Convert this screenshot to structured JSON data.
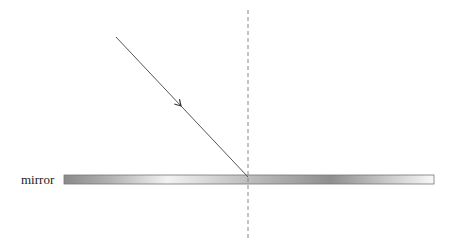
{
  "diagram": {
    "type": "reflection-incident-ray",
    "mirror": {
      "label": "mirror",
      "x": 64,
      "y": 175,
      "width": 370,
      "height": 9,
      "gradient_stops": [
        {
          "offset": 0,
          "color": "#8a8a8a"
        },
        {
          "offset": 0.12,
          "color": "#b0b0b0"
        },
        {
          "offset": 0.28,
          "color": "#f2f2f2"
        },
        {
          "offset": 0.45,
          "color": "#c8c8c8"
        },
        {
          "offset": 0.6,
          "color": "#a8a8a8"
        },
        {
          "offset": 0.72,
          "color": "#8e8e8e"
        },
        {
          "offset": 0.85,
          "color": "#c0c0c0"
        },
        {
          "offset": 1,
          "color": "#f8f8f8"
        }
      ],
      "border_color": "#777777"
    },
    "normal_line": {
      "x": 248,
      "y1": 10,
      "y2": 238,
      "color": "#888888",
      "dash": "4,3"
    },
    "incident_ray": {
      "x1": 116,
      "y1": 37,
      "x2": 248,
      "y2": 177,
      "color": "#555555"
    },
    "arrowhead": {
      "x": 181,
      "y": 106,
      "color": "#333333"
    }
  }
}
